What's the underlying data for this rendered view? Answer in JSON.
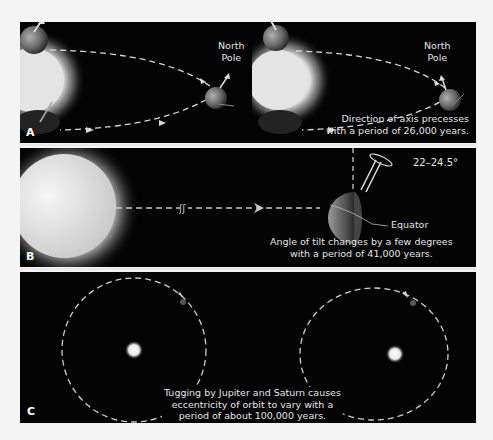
{
  "panels": {
    "a": {
      "label": "A",
      "left_pole_label_line1": "North",
      "left_pole_label_line2": "Pole",
      "right_pole_label_line1": "North",
      "right_pole_label_line2": "Pole",
      "caption_line1": "Direction of axis precesses",
      "caption_line2": "with a period of 26,000 years."
    },
    "b": {
      "label": "B",
      "angle_label": "22–24.5°",
      "equator_label": "Equator",
      "caption_line1": "Angle of tilt changes by a few degrees",
      "caption_line2": "with a period of 41,000 years."
    },
    "c": {
      "label": "C",
      "caption_line1": "Tugging by Jupiter and Saturn causes",
      "caption_line2": "eccentricity of orbit to vary with a",
      "caption_line3": "period of about 100,000 years."
    }
  },
  "colors": {
    "background": "#030303",
    "page": "#f4f4f4",
    "text": "#e6e6e6",
    "orbit_line": "#d8d8d8"
  }
}
